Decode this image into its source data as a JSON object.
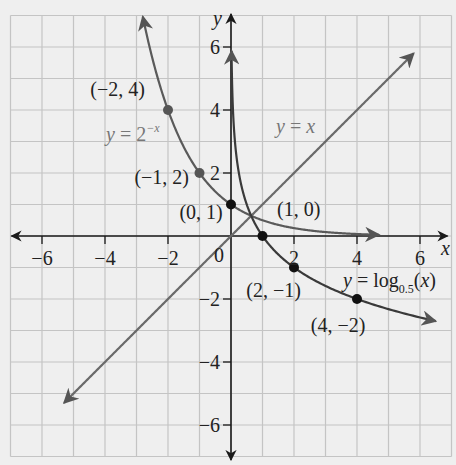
{
  "chart_data": {
    "type": "line",
    "title": "",
    "xlabel": "x",
    "ylabel": "y",
    "xlim": [
      -7,
      7
    ],
    "ylim": [
      -7,
      7
    ],
    "grid": true,
    "x_ticks": [
      -6,
      -4,
      -2,
      2,
      4,
      6
    ],
    "y_ticks": [
      -6,
      -4,
      -2,
      2,
      4,
      6
    ],
    "origin_label": "0",
    "series": [
      {
        "name": "y = 2^-x",
        "label_text": "y = 2",
        "label_sup": "−x",
        "function": "2^(-x)",
        "x_range": [
          -2.8,
          4.7
        ],
        "points": [
          {
            "x": -2,
            "y": 4,
            "label": "(−2, 4)"
          },
          {
            "x": -1,
            "y": 2,
            "label": "(−1, 2)"
          },
          {
            "x": 0,
            "y": 1,
            "label": "(0, 1)"
          }
        ],
        "color": "#5a5a5a"
      },
      {
        "name": "y = x",
        "label_text": "y = x",
        "function": "x",
        "x_range": [
          -5.3,
          5.8
        ],
        "points": [],
        "color": "#6a6a6a"
      },
      {
        "name": "y = log_0.5(x)",
        "label_text": "y = log",
        "label_sub": "0.5",
        "label_tail": "(x)",
        "function": "log0.5(x)",
        "x_range": [
          0.017,
          6.5
        ],
        "points": [
          {
            "x": 1,
            "y": 0,
            "label": "(1, 0)"
          },
          {
            "x": 2,
            "y": -1,
            "label": "(2, −1)"
          },
          {
            "x": 4,
            "y": -2,
            "label": "(4, −2)"
          }
        ],
        "color": "#3a3a3a"
      }
    ]
  },
  "colors": {
    "background": "#efefef",
    "grid": "#c4c4c4",
    "axis": "#1a1a1a",
    "text": "#222222",
    "label_gray": "#777777"
  }
}
